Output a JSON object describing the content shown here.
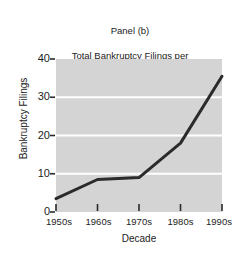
{
  "chart_data": {
    "type": "line",
    "title": "Panel (b)\nTotal Bankruptcy Filings per\n100,000 households",
    "title_lines": [
      "Panel (b)",
      "Total Bankruptcy Filings per",
      "100,000 households"
    ],
    "panel_label": "Panel (b)",
    "xlabel": "Decade",
    "ylabel": "Bankruptcy Filings",
    "categories": [
      "1950s",
      "1960s",
      "1970s",
      "1980s",
      "1990s"
    ],
    "values": [
      3.5,
      8.5,
      9,
      18,
      35.5
    ],
    "series": [
      {
        "name": "Total Bankruptcy Filings per 100,000 households",
        "values": [
          3.5,
          8.5,
          9,
          18,
          35.5
        ]
      }
    ],
    "ylim": [
      0,
      40
    ],
    "yticks": [
      0,
      10,
      20,
      30,
      40
    ],
    "ytick_labels": [
      "0",
      "10",
      "20",
      "30",
      "40"
    ],
    "xtick_labels": [
      "1950s",
      "1960s",
      "1970s",
      "1980s",
      "1990s"
    ],
    "grid": true,
    "gridlines_y": [
      10,
      20,
      30
    ],
    "legend": false,
    "legend_position": "none",
    "markers": false,
    "colors": {
      "plot_background": "#d4d4d4",
      "figure_background": "#ffffff",
      "line": "#2b2b2b",
      "gridline": "#ffffff",
      "axis": "#2a2a2a",
      "text": "#1c1c1c"
    },
    "line_width": 3
  }
}
